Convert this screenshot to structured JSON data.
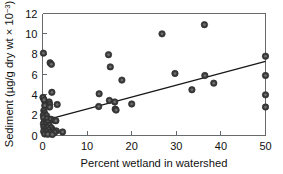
{
  "chart_data": {
    "type": "scatter",
    "title": "",
    "xlabel": "Percent wetland in watershed",
    "ylabel_parts": {
      "main": "Sediment (µg/g dry wt × 10",
      "exponent": "−3",
      "close": ")"
    },
    "ylabel": "Sediment (µg/g dry wt × 10−3)",
    "xlim": [
      0,
      50
    ],
    "ylim": [
      0,
      12
    ],
    "xticks": [
      0,
      10,
      20,
      30,
      40,
      50
    ],
    "yticks": [
      0,
      2,
      4,
      6,
      8,
      10,
      12
    ],
    "xtick_labels": [
      "0",
      "10",
      "20",
      "30",
      "40",
      "50"
    ],
    "ytick_labels": [
      "0",
      "2",
      "4",
      "6",
      "8",
      "10",
      "12"
    ],
    "grid": false,
    "legend": false,
    "marker": {
      "shape": "circle",
      "fill_color": "#3a3a3a",
      "inner_color": "#6e6e6e",
      "edge_color": "#2b2b2b",
      "radius_px": 3.2
    },
    "trendline": {
      "type": "linear",
      "color": "#171717",
      "x_start": 0,
      "y_start": 1.45,
      "x_end": 50,
      "y_end": 7.3
    },
    "points": [
      {
        "x": 0.2,
        "y": 8.1
      },
      {
        "x": 1.7,
        "y": 7.15
      },
      {
        "x": 2.0,
        "y": 7.0
      },
      {
        "x": 2.1,
        "y": 4.25
      },
      {
        "x": 0.1,
        "y": 3.75
      },
      {
        "x": 0.35,
        "y": 3.5
      },
      {
        "x": 1.5,
        "y": 3.3
      },
      {
        "x": 1.6,
        "y": 3.05
      },
      {
        "x": 3.3,
        "y": 3.05
      },
      {
        "x": 0.5,
        "y": 2.95
      },
      {
        "x": 1.6,
        "y": 2.8
      },
      {
        "x": 0.3,
        "y": 2.45
      },
      {
        "x": 0.45,
        "y": 2.2
      },
      {
        "x": 0.2,
        "y": 2.0
      },
      {
        "x": 0.9,
        "y": 1.95
      },
      {
        "x": 0.25,
        "y": 1.75
      },
      {
        "x": 1.0,
        "y": 1.65
      },
      {
        "x": 1.9,
        "y": 1.6
      },
      {
        "x": 2.6,
        "y": 1.5
      },
      {
        "x": 3.0,
        "y": 1.45
      },
      {
        "x": 0.4,
        "y": 1.35
      },
      {
        "x": 1.1,
        "y": 1.3
      },
      {
        "x": 0.2,
        "y": 1.15
      },
      {
        "x": 0.75,
        "y": 1.05
      },
      {
        "x": 1.5,
        "y": 1.0
      },
      {
        "x": 0.3,
        "y": 0.85
      },
      {
        "x": 1.0,
        "y": 0.8
      },
      {
        "x": 2.0,
        "y": 0.75
      },
      {
        "x": 0.55,
        "y": 0.6
      },
      {
        "x": 1.4,
        "y": 0.55
      },
      {
        "x": 2.4,
        "y": 0.5
      },
      {
        "x": 3.1,
        "y": 0.45
      },
      {
        "x": 0.25,
        "y": 0.4
      },
      {
        "x": 0.9,
        "y": 0.35
      },
      {
        "x": 1.8,
        "y": 0.3
      },
      {
        "x": 2.7,
        "y": 0.3
      },
      {
        "x": 4.5,
        "y": 0.35
      },
      {
        "x": 0.5,
        "y": 0.15
      },
      {
        "x": 1.2,
        "y": 0.12
      },
      {
        "x": 2.2,
        "y": 0.1
      },
      {
        "x": 12.7,
        "y": 4.1
      },
      {
        "x": 12.6,
        "y": 2.85
      },
      {
        "x": 14.8,
        "y": 7.95
      },
      {
        "x": 15.2,
        "y": 6.75
      },
      {
        "x": 15.0,
        "y": 3.45
      },
      {
        "x": 16.2,
        "y": 3.3
      },
      {
        "x": 16.3,
        "y": 2.6
      },
      {
        "x": 16.5,
        "y": 2.5
      },
      {
        "x": 17.8,
        "y": 5.45
      },
      {
        "x": 20.0,
        "y": 3.1
      },
      {
        "x": 26.8,
        "y": 10.0
      },
      {
        "x": 29.7,
        "y": 6.1
      },
      {
        "x": 33.5,
        "y": 4.5
      },
      {
        "x": 36.3,
        "y": 10.9
      },
      {
        "x": 36.4,
        "y": 5.9
      },
      {
        "x": 38.4,
        "y": 5.15
      },
      {
        "x": 50.0,
        "y": 7.8
      },
      {
        "x": 50.0,
        "y": 5.9
      },
      {
        "x": 50.0,
        "y": 4.0
      },
      {
        "x": 50.0,
        "y": 2.8
      }
    ]
  },
  "figure": {
    "background_color": "#ffffff",
    "axis_color": "#666a6d",
    "text_color": "#111111"
  }
}
